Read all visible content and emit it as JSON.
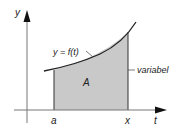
{
  "diagram": {
    "axes": {
      "y_label": "y",
      "x_label": "t"
    },
    "curve_label": "y = f(t)",
    "area_label": "A",
    "variable_label": "variabel",
    "lower_bound_label": "a",
    "upper_bound_label": "x"
  },
  "colors": {
    "fill": "#c9c9c9",
    "line": "#222222",
    "axis": "#888888"
  }
}
